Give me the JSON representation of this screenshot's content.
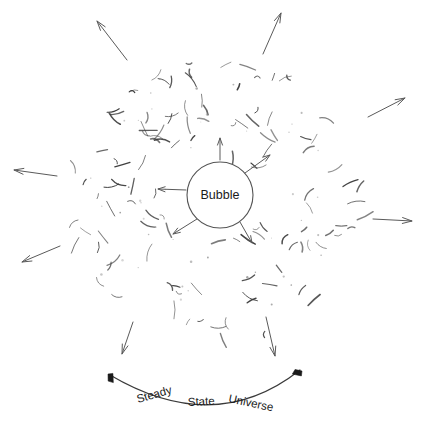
{
  "figure": {
    "type": "diagram",
    "title_caption": "Steady State Universe",
    "background_color": "#ffffff",
    "width": 430,
    "height": 430
  },
  "center_object": {
    "label": "Bubble",
    "shape": "circle",
    "cx": 220,
    "cy": 195,
    "r": 33,
    "stroke_color": "#555555",
    "fill_color": "#ffffff",
    "label_color": "#1a1a1a"
  },
  "caption": {
    "words": [
      {
        "text": "Steady",
        "x": 138,
        "y": 403,
        "rotate": -16
      },
      {
        "text": "State",
        "x": 188,
        "y": 406,
        "rotate": -3
      },
      {
        "text": "Universe",
        "x": 228,
        "y": 402,
        "rotate": 12
      }
    ],
    "color": "#1a1a1a"
  },
  "bottom_arc": {
    "description": "curved double-headed arc beneath the cloud",
    "path": "M 110 375 Q 215 437 300 370",
    "stroke_color": "#3a3a3a",
    "arrowheads": [
      {
        "name": "arc-arrowhead-left",
        "x": 108,
        "y": 374,
        "rotate": -52
      },
      {
        "name": "arc-arrowhead-right",
        "x": 302,
        "y": 371,
        "rotate": 52
      }
    ]
  },
  "inner_arrows": [
    {
      "name": "inner-arrow-up",
      "x1": 220,
      "y1": 160,
      "x2": 220,
      "y2": 138
    },
    {
      "name": "inner-arrow-upper-right",
      "x1": 245,
      "y1": 173,
      "x2": 270,
      "y2": 155
    },
    {
      "name": "inner-arrow-left",
      "x1": 186,
      "y1": 190,
      "x2": 158,
      "y2": 189
    },
    {
      "name": "inner-arrow-lower-left",
      "x1": 197,
      "y1": 219,
      "x2": 173,
      "y2": 234
    },
    {
      "name": "inner-arrow-lower-right",
      "x1": 240,
      "y1": 222,
      "x2": 252,
      "y2": 243
    }
  ],
  "outer_arrows": [
    {
      "name": "outer-arrow-north-west",
      "x1": 127,
      "y1": 60,
      "x2": 97,
      "y2": 21
    },
    {
      "name": "outer-arrow-north-east",
      "x1": 263,
      "y1": 54,
      "x2": 281,
      "y2": 13
    },
    {
      "name": "outer-arrow-east-upper",
      "x1": 368,
      "y1": 117,
      "x2": 405,
      "y2": 98
    },
    {
      "name": "outer-arrow-east-lower",
      "x1": 373,
      "y1": 219,
      "x2": 412,
      "y2": 221
    },
    {
      "name": "outer-arrow-west-upper",
      "x1": 57,
      "y1": 176,
      "x2": 14,
      "y2": 170
    },
    {
      "name": "outer-arrow-west-lower",
      "x1": 60,
      "y1": 246,
      "x2": 22,
      "y2": 262
    },
    {
      "name": "outer-arrow-south-west",
      "x1": 133,
      "y1": 322,
      "x2": 122,
      "y2": 354
    },
    {
      "name": "outer-arrow-south-east",
      "x1": 266,
      "y1": 317,
      "x2": 275,
      "y2": 356
    }
  ],
  "speckle_cloud": {
    "description": "scattered short curved galaxy marks filling a roughly circular cloud",
    "stroke_color": "#3c3c3c",
    "dot_color": "#8e8e8e",
    "center": {
      "x": 216,
      "y": 200
    },
    "radius": 145,
    "mark_count": 118,
    "dot_count": 46
  }
}
